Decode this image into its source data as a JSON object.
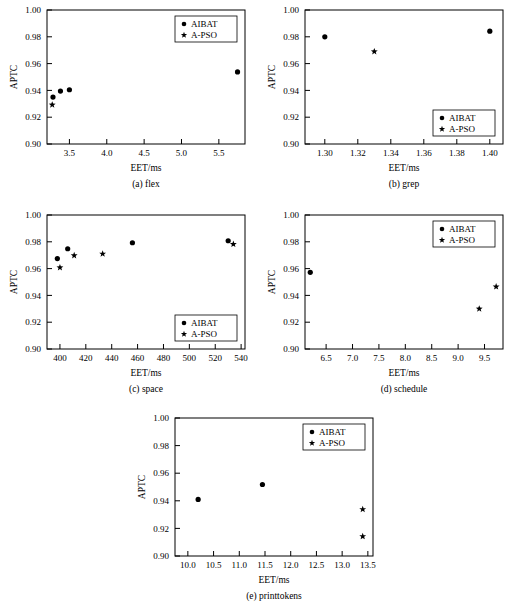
{
  "figure": {
    "axis_x_title": "EET/ms",
    "axis_y_title": "APTC",
    "legend": {
      "series_1_label": "AIBAT",
      "series_2_label": "A-PSO",
      "series_1_marker": "circle-marker",
      "series_2_marker": "star-marker"
    },
    "marker_color": "#000000"
  },
  "chart_data": [
    {
      "type": "scatter",
      "panel": "a",
      "title": "(a) flex",
      "xlabel": "EET/ms",
      "ylabel": "APTC",
      "xlim": [
        3.2,
        5.85
      ],
      "ylim": [
        0.9,
        1.0
      ],
      "xticks": [
        3.5,
        4.0,
        4.5,
        5.0,
        5.5
      ],
      "yticks": [
        0.9,
        0.92,
        0.94,
        0.96,
        0.98,
        1.0
      ],
      "xticklabels": [
        "3.5",
        "4.0",
        "4.5",
        "5.0",
        "5.5"
      ],
      "yticklabels": [
        "0.90",
        "0.92",
        "0.94",
        "0.96",
        "0.98",
        "1.00"
      ],
      "grid": false,
      "legend_position": "top-right",
      "series": [
        {
          "name": "AIBAT",
          "marker": "circle",
          "points": [
            {
              "x": 3.28,
              "y": 0.935
            },
            {
              "x": 3.38,
              "y": 0.9395
            },
            {
              "x": 3.5,
              "y": 0.9405
            },
            {
              "x": 5.75,
              "y": 0.9538
            }
          ]
        },
        {
          "name": "A-PSO",
          "marker": "star",
          "points": [
            {
              "x": 3.27,
              "y": 0.9293
            }
          ]
        }
      ]
    },
    {
      "type": "scatter",
      "panel": "b",
      "title": "(b) grep",
      "xlabel": "EET/ms",
      "ylabel": "APTC",
      "xlim": [
        1.288,
        1.408
      ],
      "ylim": [
        0.9,
        1.0
      ],
      "xticks": [
        1.3,
        1.32,
        1.34,
        1.36,
        1.38,
        1.4
      ],
      "yticks": [
        0.9,
        0.92,
        0.94,
        0.96,
        0.98,
        1.0
      ],
      "xticklabels": [
        "1.30",
        "1.32",
        "1.34",
        "1.36",
        "1.38",
        "1.40"
      ],
      "yticklabels": [
        "0.90",
        "0.92",
        "0.94",
        "0.96",
        "0.98",
        "1.00"
      ],
      "grid": false,
      "legend_position": "bottom-right",
      "series": [
        {
          "name": "AIBAT",
          "marker": "circle",
          "points": [
            {
              "x": 1.3,
              "y": 0.98
            },
            {
              "x": 1.4,
              "y": 0.9842
            }
          ]
        },
        {
          "name": "A-PSO",
          "marker": "star",
          "points": [
            {
              "x": 1.33,
              "y": 0.969
            }
          ]
        }
      ]
    },
    {
      "type": "scatter",
      "panel": "c",
      "title": "(c) space",
      "xlabel": "EET/ms",
      "ylabel": "APTC",
      "xlim": [
        390,
        543
      ],
      "ylim": [
        0.9,
        1.0
      ],
      "xticks": [
        400,
        420,
        440,
        460,
        480,
        500,
        520,
        540
      ],
      "yticks": [
        0.9,
        0.92,
        0.94,
        0.96,
        0.98,
        1.0
      ],
      "xticklabels": [
        "400",
        "420",
        "440",
        "460",
        "480",
        "500",
        "520",
        "540"
      ],
      "yticklabels": [
        "0.90",
        "0.92",
        "0.94",
        "0.96",
        "0.98",
        "1.00"
      ],
      "grid": false,
      "legend_position": "bottom-right",
      "series": [
        {
          "name": "AIBAT",
          "marker": "circle",
          "points": [
            {
              "x": 398,
              "y": 0.9675
            },
            {
              "x": 406,
              "y": 0.9748
            },
            {
              "x": 456,
              "y": 0.9793
            },
            {
              "x": 530,
              "y": 0.9808
            }
          ]
        },
        {
          "name": "A-PSO",
          "marker": "star",
          "points": [
            {
              "x": 400,
              "y": 0.9608
            },
            {
              "x": 411,
              "y": 0.9698
            },
            {
              "x": 433,
              "y": 0.971
            },
            {
              "x": 534,
              "y": 0.9782
            }
          ]
        }
      ]
    },
    {
      "type": "scatter",
      "panel": "d",
      "title": "(d) schedule",
      "xlabel": "EET/ms",
      "ylabel": "APTC",
      "xlim": [
        6.1,
        9.85
      ],
      "ylim": [
        0.9,
        1.0
      ],
      "xticks": [
        6.5,
        7.0,
        7.5,
        8.0,
        8.5,
        9.0,
        9.5
      ],
      "yticks": [
        0.9,
        0.92,
        0.94,
        0.96,
        0.98,
        1.0
      ],
      "xticklabels": [
        "6.5",
        "7.0",
        "7.5",
        "8.0",
        "8.5",
        "9.0",
        "9.5"
      ],
      "yticklabels": [
        "0.90",
        "0.92",
        "0.94",
        "0.96",
        "0.98",
        "1.00"
      ],
      "grid": false,
      "legend_position": "top-right",
      "series": [
        {
          "name": "AIBAT",
          "marker": "circle",
          "points": [
            {
              "x": 6.2,
              "y": 0.9572
            }
          ]
        },
        {
          "name": "A-PSO",
          "marker": "star",
          "points": [
            {
              "x": 9.4,
              "y": 0.93
            },
            {
              "x": 9.72,
              "y": 0.9465
            }
          ]
        }
      ]
    },
    {
      "type": "scatter",
      "panel": "e",
      "title": "(e) printtokens",
      "xlabel": "EET/ms",
      "ylabel": "APTC",
      "xlim": [
        9.75,
        13.6
      ],
      "ylim": [
        0.9,
        1.0
      ],
      "xticks": [
        10.0,
        10.5,
        11.0,
        11.5,
        12.0,
        12.5,
        13.0,
        13.5
      ],
      "yticks": [
        0.9,
        0.92,
        0.94,
        0.96,
        0.98,
        1.0
      ],
      "xticklabels": [
        "10.0",
        "10.5",
        "11.0",
        "11.5",
        "12.0",
        "12.5",
        "13.0",
        "13.5"
      ],
      "yticklabels": [
        "0.90",
        "0.92",
        "0.94",
        "0.96",
        "0.98",
        "1.00"
      ],
      "grid": false,
      "legend_position": "top-right",
      "series": [
        {
          "name": "AIBAT",
          "marker": "circle",
          "points": [
            {
              "x": 10.2,
              "y": 0.941
            },
            {
              "x": 11.45,
              "y": 0.9518
            }
          ]
        },
        {
          "name": "A-PSO",
          "marker": "star",
          "points": [
            {
              "x": 13.4,
              "y": 0.9338
            },
            {
              "x": 13.4,
              "y": 0.9142
            }
          ]
        }
      ]
    }
  ]
}
